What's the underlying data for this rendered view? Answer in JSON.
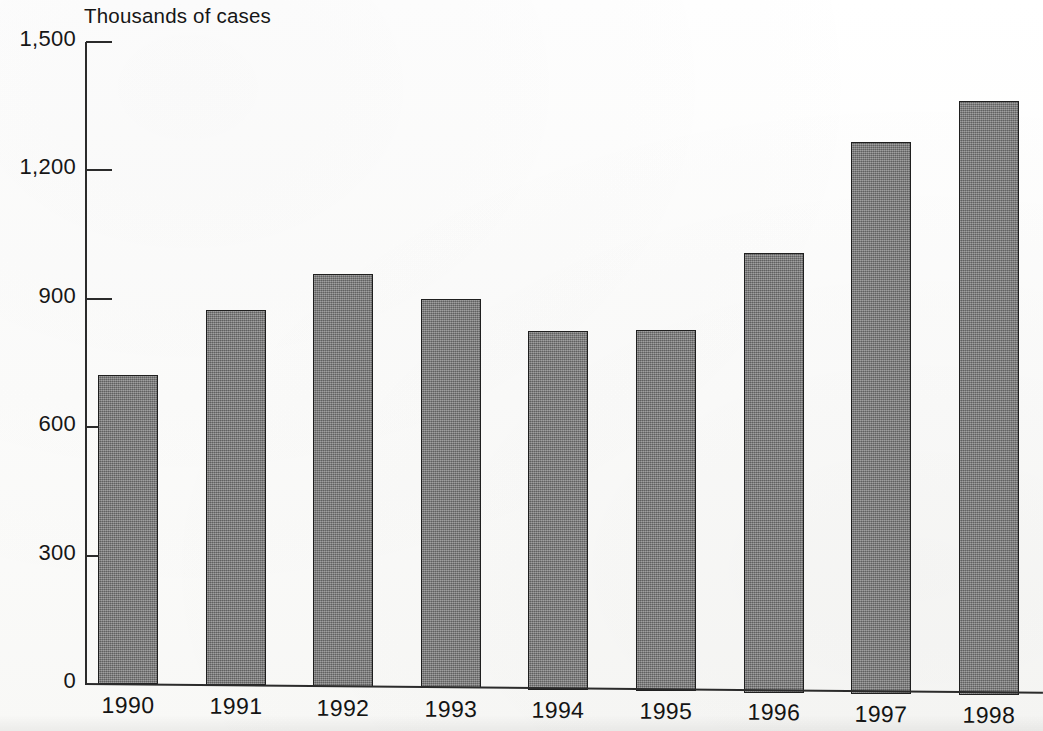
{
  "chart_data": {
    "type": "bar",
    "title": "Thousands of cases",
    "xlabel": "",
    "ylabel": "Thousands of cases",
    "categories": [
      "1990",
      "1991",
      "1992",
      "1993",
      "1994",
      "1995",
      "1996",
      "1997",
      "1998"
    ],
    "values": [
      723,
      874,
      960,
      902,
      828,
      830,
      1010,
      1272,
      1367
    ],
    "ylim": [
      0,
      1500
    ],
    "y_ticks": [
      0,
      300,
      600,
      900,
      1200,
      1500
    ],
    "y_tick_labels": [
      "0",
      "300",
      "600",
      "900",
      "1,200",
      "1,500"
    ],
    "grid": false,
    "legend": null,
    "series": [
      {
        "name": "Cases",
        "values": [
          723,
          874,
          960,
          902,
          828,
          830,
          1010,
          1272,
          1367
        ]
      }
    ],
    "colors": {
      "bar_fill": "#7c7c7c",
      "bar_border": "#1f1f1f",
      "axis": "#2b2b2b",
      "text": "#161616",
      "background": "#fdfdfc"
    }
  },
  "axis": {
    "title": "Thousands of cases",
    "y_labels": [
      {
        "text": "1,500",
        "value": 1500
      },
      {
        "text": "1,200",
        "value": 1200
      },
      {
        "text": "900",
        "value": 900
      },
      {
        "text": "600",
        "value": 600
      },
      {
        "text": "300",
        "value": 300
      },
      {
        "text": "0",
        "value": 0
      }
    ],
    "x_labels": [
      "1990",
      "1991",
      "1992",
      "1993",
      "1994",
      "1995",
      "1996",
      "1997",
      "1998"
    ]
  }
}
